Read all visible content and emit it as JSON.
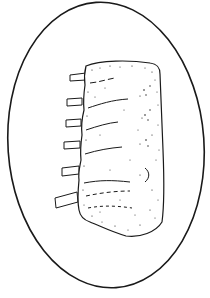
{
  "image": {
    "subject": "Line illustration of a rib roast (rack of ribs) on an oval platter",
    "colors": {
      "background": "#ffffff",
      "ink": "#1a1a1a"
    },
    "platter": {
      "shape": "oval",
      "cx": 106,
      "cy": 145,
      "rx": 98,
      "ry": 143,
      "rotation_deg": -4
    },
    "roast": {
      "rib_bones_visible": 6
    }
  }
}
